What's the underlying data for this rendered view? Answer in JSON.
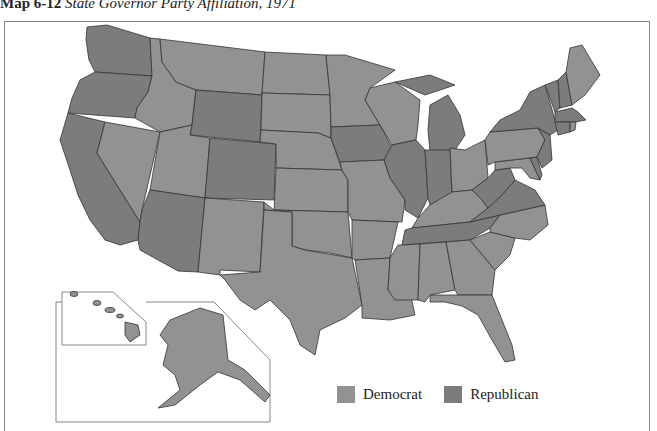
{
  "title": {
    "number": "Map 6-12",
    "text": "State Governor Party Affiliation, 1971"
  },
  "colors": {
    "democrat": "#929292",
    "republican": "#7c7c7c",
    "border": "#333333",
    "frame": "#888888"
  },
  "legend": [
    {
      "label": "Democrat",
      "key": "democrat"
    },
    {
      "label": "Republican",
      "key": "republican"
    }
  ],
  "states": {
    "WA": "republican",
    "OR": "republican",
    "CA": "republican",
    "NV": "democrat",
    "ID": "democrat",
    "MT": "democrat",
    "WY": "republican",
    "UT": "democrat",
    "AZ": "republican",
    "CO": "republican",
    "NM": "democrat",
    "ND": "democrat",
    "SD": "democrat",
    "NE": "democrat",
    "KS": "democrat",
    "OK": "democrat",
    "TX": "democrat",
    "MN": "democrat",
    "IA": "republican",
    "MO": "democrat",
    "AR": "democrat",
    "LA": "democrat",
    "WI": "democrat",
    "IL": "republican",
    "MI": "republican",
    "IN": "republican",
    "OH": "democrat",
    "KY": "democrat",
    "TN": "republican",
    "MS": "democrat",
    "AL": "democrat",
    "GA": "democrat",
    "FL": "democrat",
    "SC": "democrat",
    "NC": "democrat",
    "VA": "republican",
    "WV": "republican",
    "MD": "democrat",
    "DE": "republican",
    "PA": "democrat",
    "NJ": "republican",
    "NY": "republican",
    "CT": "republican",
    "RI": "democrat",
    "MA": "republican",
    "VT": "republican",
    "NH": "republican",
    "ME": "democrat",
    "AK": "democrat",
    "HI": "democrat"
  }
}
